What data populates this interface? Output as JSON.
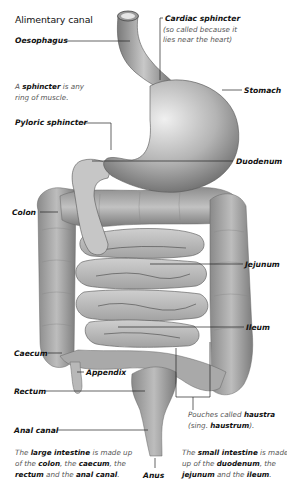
{
  "title": "Alimentary canal",
  "labels": {
    "oesophagus": "Oesophagus",
    "cardiac_sphincter": "Cardiac sphincter",
    "cardiac_note_line1": "(so called because it",
    "cardiac_note_line2": "lies near the heart)",
    "stomach": "Stomach",
    "pyloric_sphincter": "Pyloric sphincter",
    "duodenum": "Duodenum",
    "colon": "Colon",
    "jejunum": "Jejunum",
    "ileum": "Ileum",
    "caecum": "Caecum",
    "appendix": "Appendix",
    "rectum": "Rectum",
    "anal_canal": "Anal canal",
    "anus": "Anus"
  },
  "notes": {
    "sphincter": {
      "pre": "A ",
      "bold": "sphincter",
      "post": " is any",
      "line2": "ring of muscle."
    },
    "haustra": {
      "pre": "Pouches called ",
      "bold": "haustra",
      "line2_pre": "(sing. ",
      "line2_bold": "haustrum",
      "line2_post": ")."
    },
    "large_intestine": {
      "l1_pre": "The ",
      "l1_bold": "large intestine",
      "l1_post": " is made up",
      "l2_pre": "of the ",
      "l2_b1": "colon",
      "l2_mid": ", the ",
      "l2_b2": "caecum",
      "l2_post": ", the",
      "l3_b1": "rectum",
      "l3_mid": " and the ",
      "l3_b2": "anal canal",
      "l3_post": "."
    },
    "small_intestine": {
      "l1_pre": "The ",
      "l1_bold": "small intestine",
      "l1_post": " is made",
      "l2_pre": "up of the ",
      "l2_b1": "duodenum",
      "l2_post": ", the",
      "l3_b1": "jejunum",
      "l3_mid": " and the ",
      "l3_b2": "ileum",
      "l3_post": "."
    }
  },
  "colors": {
    "organ_light": "#d6d6d6",
    "organ_mid": "#a8a8a8",
    "organ_dark": "#6e6e6e",
    "leader_line": "#222222",
    "note_text": "#555555"
  }
}
